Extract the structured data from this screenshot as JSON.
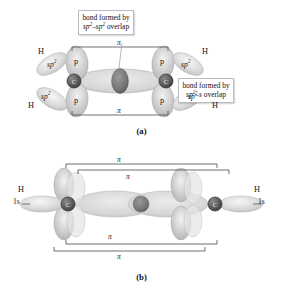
{
  "figure": {
    "background": "#ffffff",
    "atom_color": "#5d5d5d",
    "orbital_color": "#c9c9c9",
    "line_color": "#4a4a4a"
  },
  "panel_a": {
    "caption": "(a)",
    "molecule": "ethene",
    "callouts": [
      {
        "id": "sigma-sp2-sp2",
        "line1": "bond formed by",
        "line2_pre": "sp",
        "line2_sup": "2",
        "line2_mid": "–sp",
        "line2_sup2": "2",
        "line2_post": " overlap",
        "full_text": "bond formed by sp2–sp2 overlap"
      },
      {
        "id": "sigma-sp2-s",
        "line1": "bond formed by",
        "line2_pre": "sp",
        "line2_sup": "2",
        "line2_mid": "–s",
        "line2_post": " overlap",
        "full_text": "bond formed by sp2–s overlap"
      }
    ],
    "atoms": [
      {
        "label": "C",
        "position": "left"
      },
      {
        "label": "C",
        "position": "right"
      }
    ],
    "orbital_labels": [
      {
        "text": "p",
        "position": "left-top"
      },
      {
        "text": "p",
        "position": "left-bottom"
      },
      {
        "text": "p",
        "position": "right-top"
      },
      {
        "text": "p",
        "position": "right-bottom"
      }
    ],
    "hybrid_labels": [
      {
        "base": "sp",
        "sup": "2",
        "position": "left-upper"
      },
      {
        "base": "sp",
        "sup": "2",
        "position": "left-lower"
      },
      {
        "base": "sp",
        "sup": "2",
        "position": "right-upper"
      },
      {
        "base": "sp",
        "sup": "2",
        "position": "right-lower"
      }
    ],
    "hydrogen_labels": [
      {
        "text": "H",
        "position": "left-upper"
      },
      {
        "text": "H",
        "position": "left-lower"
      },
      {
        "text": "H",
        "position": "right-upper"
      },
      {
        "text": "H",
        "position": "right-lower"
      }
    ],
    "pi_labels": [
      {
        "text": "π",
        "position": "top"
      },
      {
        "text": "π",
        "position": "bottom"
      }
    ]
  },
  "panel_b": {
    "caption": "(b)",
    "molecule": "ethyne",
    "atoms": [
      {
        "label": "C",
        "position": "left"
      },
      {
        "label": "C",
        "position": "right"
      }
    ],
    "hydrogen_labels": [
      {
        "text": "H",
        "position": "left"
      },
      {
        "text": "H",
        "position": "right"
      }
    ],
    "orbital_labels": [
      {
        "text": "1s",
        "position": "left"
      },
      {
        "text": "1s",
        "position": "right"
      }
    ],
    "pi_labels": [
      {
        "text": "π",
        "position": "top-outer"
      },
      {
        "text": "π",
        "position": "top-inner"
      },
      {
        "text": "π",
        "position": "bottom-inner"
      },
      {
        "text": "π",
        "position": "bottom-outer"
      }
    ]
  }
}
